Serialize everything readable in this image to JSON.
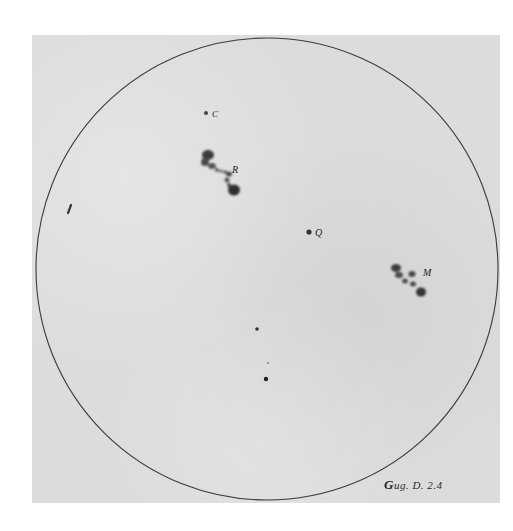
{
  "image": {
    "subject": "Sunspot drawing on solar disk",
    "paper_color": "#dcdcdc",
    "ink_color": "#2a2a2a"
  },
  "disk": {
    "cx": 267,
    "cy": 269,
    "r": 231
  },
  "labels": {
    "c": "C",
    "r": "R",
    "q": "Q",
    "m": "M"
  },
  "caption": {
    "initial": "G",
    "text": "ug. D. 2.4"
  }
}
